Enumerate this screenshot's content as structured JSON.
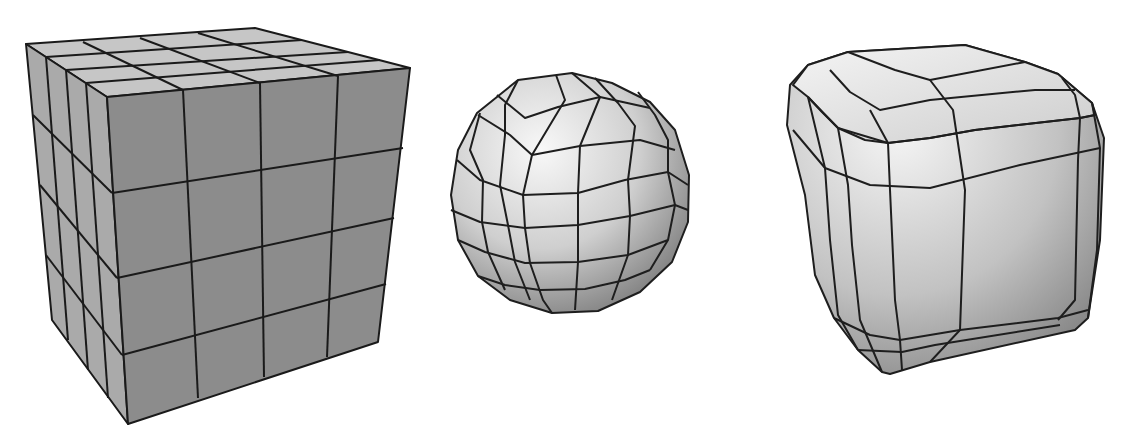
{
  "figure": {
    "background": "#ffffff",
    "line_color": "#1a1a1a",
    "models": [
      {
        "id": "subdivided-cube",
        "name": "Subdivided cube (4x4 grid per face)",
        "shading": "flat gray",
        "face_color": "#8a8a8a",
        "top_color": "#c4c4c4",
        "side_color": "#a9a9a9"
      },
      {
        "id": "spherified-cube",
        "name": "Sphere (spherified cube mesh)",
        "shading": "smooth gradient",
        "highlight": "#f2f2f2",
        "shadow": "#8c8c8c"
      },
      {
        "id": "rounded-cube",
        "name": "Rounded cube (beveled edges)",
        "shading": "smooth gradient",
        "highlight": "#f0f0f0",
        "shadow": "#8a8a8a"
      }
    ]
  }
}
